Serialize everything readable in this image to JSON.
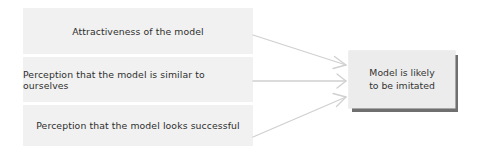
{
  "diagram": {
    "type": "flow",
    "factors": [
      {
        "label": "Attractiveness of the model"
      },
      {
        "label": "Perception that the model is similar to ourselves"
      },
      {
        "label": "Perception that the model looks successful"
      }
    ],
    "outcome": {
      "line1": "Model is likely",
      "line2": "to be imitated"
    },
    "edges": [
      {
        "from": "Attractiveness of the model",
        "to": "Model is likely to be imitated"
      },
      {
        "from": "Perception that the model is similar to ourselves",
        "to": "Model is likely to be imitated"
      },
      {
        "from": "Perception that the model looks successful",
        "to": "Model is likely to be imitated"
      }
    ],
    "colors": {
      "factor_fill": "#f1f1f1",
      "outcome_fill": "#ececec",
      "outcome_shadow": "#6f6f6f",
      "arrow": "#d0d0d0",
      "text": "#2e2e2e"
    }
  }
}
